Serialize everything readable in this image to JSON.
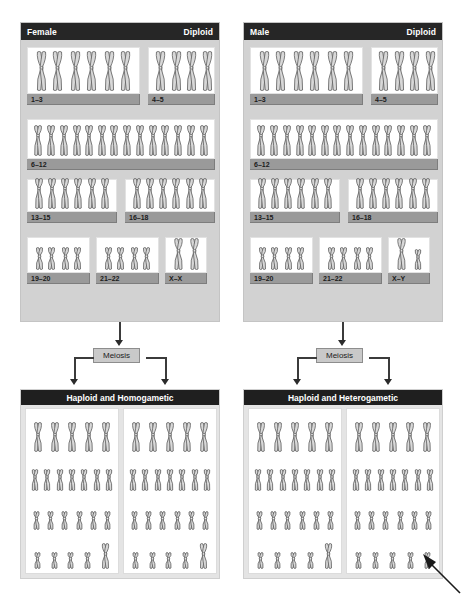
{
  "figure": {
    "arrow_annotation": "pointer-to-Y-chromosome"
  },
  "diploid": {
    "female": {
      "sex_label": "Female",
      "ploidy_label": "Diploid",
      "groups": [
        {
          "label": "1–3",
          "pairs": 3,
          "size": "large",
          "type": "metacentric"
        },
        {
          "label": "4–5",
          "pairs": 2,
          "size": "large",
          "type": "submetacentric"
        },
        {
          "label": "6–12",
          "pairs": 7,
          "size": "medium",
          "type": "submetacentric"
        },
        {
          "label": "13–15",
          "pairs": 3,
          "size": "medium",
          "type": "acrocentric"
        },
        {
          "label": "16–18",
          "pairs": 3,
          "size": "medium",
          "type": "submetacentric"
        },
        {
          "label": "19–20",
          "pairs": 2,
          "size": "small",
          "type": "metacentric"
        },
        {
          "label": "21–22",
          "pairs": 2,
          "size": "small",
          "type": "acrocentric"
        },
        {
          "label": "X–X",
          "pairs": 1,
          "size": "sex",
          "type": "XX"
        }
      ]
    },
    "male": {
      "sex_label": "Male",
      "ploidy_label": "Diploid",
      "groups": [
        {
          "label": "1–3",
          "pairs": 3,
          "size": "large",
          "type": "metacentric"
        },
        {
          "label": "4–5",
          "pairs": 2,
          "size": "large",
          "type": "submetacentric"
        },
        {
          "label": "6–12",
          "pairs": 7,
          "size": "medium",
          "type": "submetacentric"
        },
        {
          "label": "13–15",
          "pairs": 3,
          "size": "medium",
          "type": "acrocentric"
        },
        {
          "label": "16–18",
          "pairs": 3,
          "size": "medium",
          "type": "submetacentric"
        },
        {
          "label": "19–20",
          "pairs": 2,
          "size": "small",
          "type": "metacentric"
        },
        {
          "label": "21–22",
          "pairs": 2,
          "size": "small",
          "type": "acrocentric"
        },
        {
          "label": "X–Y",
          "pairs": 1,
          "size": "sex",
          "type": "XY"
        }
      ]
    }
  },
  "process": {
    "female_step_label": "Meiosis",
    "male_step_label": "Meiosis"
  },
  "haploid": {
    "female": {
      "header": "Haploid and Homogametic",
      "gametes": [
        {
          "name": "gamete-1",
          "sex_chromosome": "X"
        },
        {
          "name": "gamete-2",
          "sex_chromosome": "X"
        }
      ],
      "rows_per_gamete": [
        5,
        7,
        6,
        5
      ]
    },
    "male": {
      "header": "Haploid and Heterogametic",
      "gametes": [
        {
          "name": "gamete-1",
          "sex_chromosome": "X"
        },
        {
          "name": "gamete-2",
          "sex_chromosome": "Y"
        }
      ],
      "rows_per_gamete": [
        5,
        7,
        6,
        5
      ]
    }
  },
  "colors": {
    "header_bar": "#262626",
    "panel_background": "#d2d2d2",
    "haploid_background": "#e4e4e4",
    "group_label_bar": "#9a9a9a",
    "chromosome_fill": "#d8d8d8",
    "chromosome_stroke": "#5d5d5d",
    "meiosis_box": "#c9c9c9"
  }
}
